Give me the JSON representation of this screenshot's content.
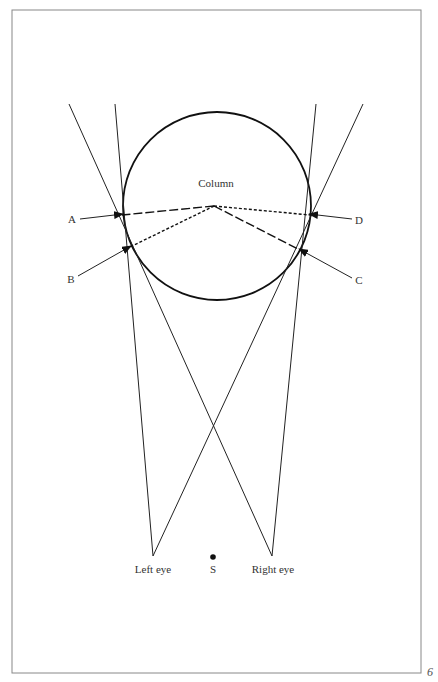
{
  "figure": {
    "title": "Column",
    "labels": {
      "A": "A",
      "B": "B",
      "C": "C",
      "D": "D",
      "left_eye": "Left eye",
      "right_eye": "Right eye",
      "center_point": "S"
    },
    "page_number": "6"
  },
  "colors": {
    "stroke": "#222222",
    "frame": "#888888",
    "background": "#ffffff"
  }
}
